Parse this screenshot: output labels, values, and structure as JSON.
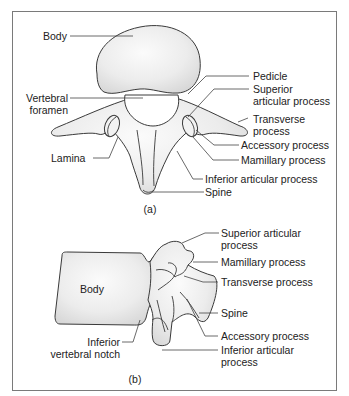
{
  "figure": {
    "panels": [
      {
        "id": "a",
        "caption": "(a)",
        "view": "superior view",
        "labels": {
          "body": "Body",
          "vertebral_foramen_1": "Vertebral",
          "vertebral_foramen_2": "foramen",
          "lamina": "Lamina",
          "pedicle": "Pedicle",
          "superior_articular_1": "Superior",
          "superior_articular_2": "articular process",
          "transverse_1": "Transverse",
          "transverse_2": "process",
          "accessory": "Accessory process",
          "mamillary": "Mamillary process",
          "inferior_articular": "Inferior articular process",
          "spine": "Spine"
        }
      },
      {
        "id": "b",
        "caption": "(b)",
        "view": "lateral view",
        "labels": {
          "superior_articular_1": "Superior articular",
          "superior_articular_2": "process",
          "mamillary": "Mamillary process",
          "transverse": "Transverse process",
          "body": "Body",
          "spine": "Spine",
          "inferior_notch_1": "Inferior",
          "inferior_notch_2": "vertebral notch",
          "accessory": "Accessory process",
          "inferior_articular_1": "Inferior articular",
          "inferior_articular_2": "process"
        }
      }
    ]
  },
  "colors": {
    "frame": "#7a7a7a",
    "outline": "#3a3a3a",
    "fill_light": "#f7f7f7",
    "fill_shade": "#d9d9d9",
    "text": "#222222"
  }
}
